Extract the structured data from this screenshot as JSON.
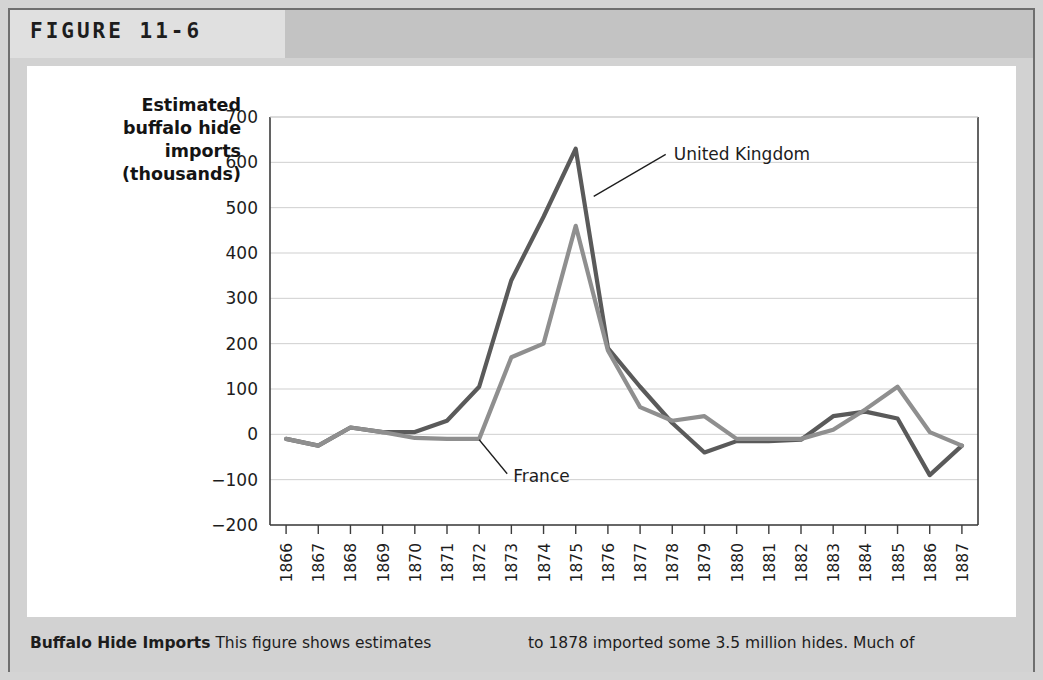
{
  "figure": {
    "label": "FIGURE 11-6"
  },
  "caption": {
    "bold_lead": "Buffalo Hide Imports",
    "left_text": "This figure shows estimates",
    "right_text": "to 1878 imported some 3.5 million hides. Much of"
  },
  "colors": {
    "united_kingdom": "#5a5a5a",
    "france": "#8f8f8f",
    "axis": "#3c3c3c",
    "grid": "#cfcfcf",
    "panel_background": "#ffffff",
    "frame_background": "#d2d2d2",
    "header_band": "#c3c3c3"
  },
  "chart_data": {
    "type": "line",
    "title": "",
    "ylabel": "Estimated buffalo hide imports (thousands)",
    "ylabel_lines": [
      "Estimated",
      "buffalo hide",
      "imports",
      "(thousands)"
    ],
    "xlabel": "",
    "ylim": [
      -200,
      700
    ],
    "yticks": [
      700,
      600,
      500,
      400,
      300,
      200,
      100,
      0,
      -100,
      -200
    ],
    "ytick_labels": [
      "700",
      "600",
      "500",
      "400",
      "300",
      "200",
      "100",
      "0",
      "−100",
      "−200"
    ],
    "grid": true,
    "legend": "annotations",
    "categories": [
      "1866",
      "1867",
      "1868",
      "1869",
      "1870",
      "1871",
      "1872",
      "1873",
      "1874",
      "1875",
      "1876",
      "1877",
      "1878",
      "1879",
      "1880",
      "1881",
      "1882",
      "1883",
      "1884",
      "1885",
      "1886",
      "1887"
    ],
    "series": [
      {
        "name": "United Kingdom",
        "color": "#5a5a5a",
        "values": [
          -10,
          -25,
          15,
          5,
          5,
          30,
          105,
          340,
          480,
          630,
          190,
          105,
          25,
          -40,
          -15,
          -15,
          -12,
          40,
          50,
          35,
          -90,
          -25
        ],
        "annotation": {
          "label": "United Kingdom",
          "points_at_year": "1875"
        }
      },
      {
        "name": "France",
        "color": "#8f8f8f",
        "values": [
          -10,
          -25,
          15,
          5,
          -8,
          -10,
          -10,
          170,
          200,
          460,
          185,
          60,
          30,
          40,
          -10,
          -10,
          -10,
          10,
          55,
          105,
          5,
          -25
        ],
        "annotation": {
          "label": "France",
          "points_at_year": "1872"
        }
      }
    ],
    "annotations": [
      {
        "text": "United Kingdom",
        "x_year": "1875",
        "y_value": 540
      },
      {
        "text": "France",
        "x_year": "1872",
        "y_value": -75
      }
    ]
  }
}
